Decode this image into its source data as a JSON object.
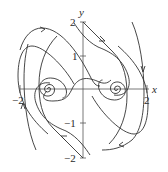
{
  "figure": {
    "type": "phase-portrait",
    "axes": {
      "x_label": "x",
      "y_label": "y",
      "x_ticks": [
        {
          "value": -2,
          "label": "−2"
        },
        {
          "value": 2,
          "label": "2"
        }
      ],
      "y_ticks": [
        {
          "value": 2,
          "label": "2"
        },
        {
          "value": 1,
          "label": "1"
        },
        {
          "value": -1,
          "label": "−1"
        },
        {
          "value": -2,
          "label": "−2"
        }
      ],
      "x_range": [
        -2,
        2
      ],
      "y_range": [
        -2,
        2
      ]
    },
    "equilibria": [
      {
        "x": -1,
        "y": 0,
        "type": "spiral"
      },
      {
        "x": 1,
        "y": 0,
        "type": "spiral"
      },
      {
        "x": 0,
        "y": 0,
        "type": "saddle"
      }
    ],
    "colors": {
      "axis": "#555555",
      "trajectory": "#333333",
      "background": "#ffffff"
    }
  }
}
